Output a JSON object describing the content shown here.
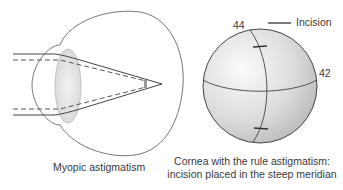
{
  "figure": {
    "left_panel": {
      "caption": "Myopic astigmatism",
      "elements": [
        "eyeball-outline",
        "lens",
        "solid-rays",
        "dashed-rays",
        "focal-point"
      ]
    },
    "right_panel": {
      "caption_line1": "Cornea with the rule astigmatism:",
      "caption_line2": "incision placed in the steep meridian",
      "steep_meridian_value": "44",
      "flat_meridian_value": "42",
      "legend": {
        "label": "Incision"
      }
    },
    "colors": {
      "stroke": "#444444",
      "lens_fill": "#e6e6e6",
      "sphere_light": "#fafafa",
      "sphere_dark": "#bdbdbd"
    }
  }
}
